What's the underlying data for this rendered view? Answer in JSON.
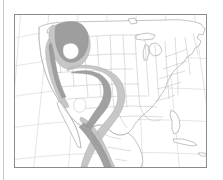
{
  "figure": {
    "domain_type": "map",
    "title": "",
    "caption": "",
    "map_type": "species-range-map",
    "region": "North America (contiguous United States and northern Mexico)",
    "projection_hint": "conic, curved graticule",
    "background_color": "#ffffff",
    "frame_color": "#8a8a8a",
    "frame": {
      "left": 14,
      "top": 14,
      "width": 193,
      "height": 154
    },
    "page_rule": {
      "x": 3,
      "color": "#c8c8c8"
    }
  },
  "legend": {
    "present": false,
    "entries": [
      {
        "name": "range-core",
        "label": "",
        "color": "#9c9c9c"
      },
      {
        "name": "range-peripheral",
        "label": "",
        "color": "#c2c2c2"
      }
    ]
  },
  "axes": {
    "labels_present": false,
    "tick_labels": [],
    "graticule_visible": true,
    "graticule_color": "#cfcfcf"
  },
  "map_layers": {
    "coastline": {
      "name": "coastline-outline",
      "stroke": "#9a9a9a"
    },
    "state_borders": {
      "name": "state-boundaries",
      "stroke": "#b2b2b2"
    },
    "range_light": {
      "name": "range-peripheral-shading",
      "fill": "#c2c2c2"
    },
    "range_dark": {
      "name": "range-core-shading",
      "fill": "#9c9c9c"
    }
  },
  "annotations": [],
  "text_elements": []
}
